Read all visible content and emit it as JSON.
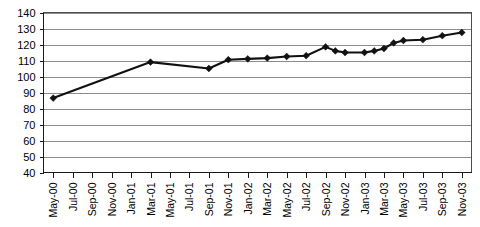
{
  "chart_data": {
    "type": "line",
    "title": "",
    "subtitle": "",
    "xlabel": "",
    "ylabel": "",
    "ylim": [
      40,
      140
    ],
    "ytick_step": 10,
    "yticks": [
      40,
      50,
      60,
      70,
      80,
      90,
      100,
      110,
      120,
      130,
      140
    ],
    "grid": true,
    "grid_axis": "y",
    "legend": false,
    "legend_position": "none",
    "marker": "diamond",
    "line_color": "#111111",
    "categories": [
      "May-00",
      "Jul-00",
      "Sep-00",
      "Nov-00",
      "Jan-01",
      "Mar-01",
      "May-01",
      "Jul-01",
      "Sep-01",
      "Nov-01",
      "Jan-02",
      "Mar-02",
      "May-02",
      "Jul-02",
      "Sep-02",
      "Nov-02",
      "Jan-03",
      "Mar-03",
      "May-03",
      "Jul-03",
      "Sep-03",
      "Nov-03"
    ],
    "values": [
      86.5,
      null,
      null,
      null,
      null,
      109,
      null,
      null,
      105,
      110.5,
      null,
      111.5,
      null,
      113,
      118.5,
      115,
      115,
      117.5,
      122.5,
      123,
      125.5,
      127.5
    ],
    "series": [
      {
        "name": "Index",
        "points": [
          {
            "x": "May-00",
            "y": 86.5
          },
          {
            "x": "Mar-01",
            "y": 109
          },
          {
            "x": "Sep-01",
            "y": 105
          },
          {
            "x": "Nov-01",
            "y": 110.5
          },
          {
            "x": "Jan-02",
            "y": 111
          },
          {
            "x": "Mar-02",
            "y": 111.5
          },
          {
            "x": "May-02",
            "y": 112.5
          },
          {
            "x": "Jul-02",
            "y": 113
          },
          {
            "x": "Sep-02",
            "y": 118.5
          },
          {
            "x": "Oct-02",
            "y": 116
          },
          {
            "x": "Nov-02",
            "y": 115
          },
          {
            "x": "Jan-03",
            "y": 115
          },
          {
            "x": "Feb-03",
            "y": 116
          },
          {
            "x": "Mar-03",
            "y": 117.5
          },
          {
            "x": "Apr-03",
            "y": 121
          },
          {
            "x": "May-03",
            "y": 122.5
          },
          {
            "x": "Jul-03",
            "y": 123
          },
          {
            "x": "Sep-03",
            "y": 125.5
          },
          {
            "x": "Nov-03",
            "y": 127.5
          }
        ]
      }
    ]
  }
}
